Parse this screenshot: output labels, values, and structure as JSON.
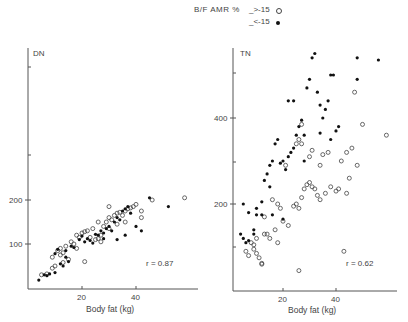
{
  "legend": {
    "title": "B/F AMR %",
    "open_label": "_>-15",
    "filled_label": "_<-15",
    "open_symbol": "open-circle",
    "filled_symbol": "filled-circle"
  },
  "caption": "",
  "chart_data": [
    {
      "type": "scatter",
      "title": "DN",
      "xlabel": "Body fat (kg)",
      "ylabel": "DN",
      "x_ticks": [
        20,
        40
      ],
      "y_ticks": [
        100,
        200
      ],
      "y_minor_ticks": [
        300,
        500
      ],
      "xlim": [
        0,
        63
      ],
      "ylim": [
        0,
        500
      ],
      "annotation": "r = 0.87",
      "series": [
        {
          "name": ">-15 (open)",
          "points": [
            [
              5,
              30
            ],
            [
              7,
              32
            ],
            [
              9,
              45
            ],
            [
              10,
              50
            ],
            [
              9,
              70
            ],
            [
              11,
              85
            ],
            [
              12,
              90
            ],
            [
              13,
              80
            ],
            [
              14,
              95
            ],
            [
              12,
              75
            ],
            [
              16,
              105
            ],
            [
              17,
              100
            ],
            [
              18,
              120
            ],
            [
              20,
              125
            ],
            [
              21,
              128
            ],
            [
              22,
              130
            ],
            [
              19,
              115
            ],
            [
              23,
              115
            ],
            [
              25,
              110
            ],
            [
              26,
              112
            ],
            [
              27,
              120
            ],
            [
              28,
              140
            ],
            [
              29,
              150
            ],
            [
              30,
              160
            ],
            [
              31,
              155
            ],
            [
              32,
              165
            ],
            [
              33,
              170
            ],
            [
              34,
              172
            ],
            [
              35,
              165
            ],
            [
              36,
              175
            ],
            [
              37,
              180
            ],
            [
              38,
              182
            ],
            [
              39,
              185
            ],
            [
              40,
              190
            ],
            [
              42,
              160
            ],
            [
              42,
              175
            ],
            [
              36,
              150
            ],
            [
              33,
              145
            ],
            [
              30,
              135
            ],
            [
              30,
              185
            ],
            [
              26,
              150
            ],
            [
              24,
              135
            ],
            [
              46,
              200
            ],
            [
              58,
              205
            ],
            [
              21,
              60
            ],
            [
              15,
              65
            ],
            [
              13,
              58
            ],
            [
              18,
              90
            ],
            [
              27,
              105
            ]
          ]
        },
        {
          "name": "<-15 (filled)",
          "points": [
            [
              4,
              18
            ],
            [
              6,
              30
            ],
            [
              7,
              28
            ],
            [
              8,
              32
            ],
            [
              10,
              35
            ],
            [
              12,
              55
            ],
            [
              13,
              50
            ],
            [
              14,
              70
            ],
            [
              15,
              60
            ],
            [
              14,
              85
            ],
            [
              16,
              95
            ],
            [
              17,
              92
            ],
            [
              19,
              110
            ],
            [
              20,
              118
            ],
            [
              21,
              105
            ],
            [
              22,
              112
            ],
            [
              23,
              108
            ],
            [
              24,
              102
            ],
            [
              26,
              120
            ],
            [
              27,
              130
            ],
            [
              28,
              125
            ],
            [
              29,
              135
            ],
            [
              30,
              140
            ],
            [
              31,
              130
            ],
            [
              32,
              150
            ],
            [
              33,
              160
            ],
            [
              34,
              155
            ],
            [
              35,
              175
            ],
            [
              36,
              180
            ],
            [
              37,
              185
            ],
            [
              38,
              170
            ],
            [
              40,
              140
            ],
            [
              42,
              130
            ],
            [
              45,
              205
            ],
            [
              52,
              185
            ],
            [
              33,
              110
            ],
            [
              36,
              120
            ],
            [
              28,
              112
            ],
            [
              10,
              78
            ],
            [
              11,
              88
            ],
            [
              25,
              122
            ]
          ]
        }
      ]
    },
    {
      "type": "scatter",
      "title": "TN",
      "xlabel": "Body fat (kg)",
      "ylabel": "TN",
      "x_ticks": [
        20,
        40
      ],
      "y_ticks": [
        200,
        400
      ],
      "y_minor_ticks": [
        100,
        300,
        500
      ],
      "xlim": [
        0,
        63
      ],
      "ylim": [
        0,
        560
      ],
      "annotation": "r = 0.62",
      "series": [
        {
          "name": ">-15 (open)",
          "points": [
            [
              6,
              90
            ],
            [
              7,
              80
            ],
            [
              9,
              105
            ],
            [
              9,
              95
            ],
            [
              10,
              85
            ],
            [
              11,
              75
            ],
            [
              12,
              62
            ],
            [
              12,
              60
            ],
            [
              8,
              110
            ],
            [
              10,
              120
            ],
            [
              13,
              130
            ],
            [
              15,
              120
            ],
            [
              17,
              140
            ],
            [
              20,
              160
            ],
            [
              22,
              150
            ],
            [
              24,
              195
            ],
            [
              25,
              200
            ],
            [
              26,
              190
            ],
            [
              27,
              215
            ],
            [
              28,
              235
            ],
            [
              29,
              245
            ],
            [
              30,
              250
            ],
            [
              31,
              240
            ],
            [
              32,
              235
            ],
            [
              33,
              220
            ],
            [
              34,
              210
            ],
            [
              36,
              225
            ],
            [
              38,
              240
            ],
            [
              40,
              230
            ],
            [
              42,
              300
            ],
            [
              44,
              320
            ],
            [
              46,
              330
            ],
            [
              48,
              290
            ],
            [
              45,
              260
            ],
            [
              35,
              315
            ],
            [
              37,
              320
            ],
            [
              30,
              310
            ],
            [
              31,
              325
            ],
            [
              34,
              290
            ],
            [
              25,
              340
            ],
            [
              26,
              350
            ],
            [
              27,
              340
            ],
            [
              21,
              290
            ],
            [
              18,
              200
            ],
            [
              16,
              210
            ],
            [
              14,
              130
            ],
            [
              13,
              170
            ],
            [
              19,
              190
            ],
            [
              41,
              235
            ],
            [
              44,
              225
            ],
            [
              50,
              385
            ],
            [
              59,
              360
            ],
            [
              27,
              385
            ],
            [
              47,
              460
            ],
            [
              26,
              45
            ],
            [
              18,
              110
            ],
            [
              43,
              90
            ]
          ]
        },
        {
          "name": "<-15 (filled)",
          "points": [
            [
              4,
              130
            ],
            [
              5,
              120
            ],
            [
              5,
              200
            ],
            [
              6,
              110
            ],
            [
              7,
              115
            ],
            [
              9,
              130
            ],
            [
              9,
              140
            ],
            [
              10,
              190
            ],
            [
              12,
              205
            ],
            [
              13,
              255
            ],
            [
              14,
              270
            ],
            [
              15,
              290
            ],
            [
              16,
              300
            ],
            [
              17,
              340
            ],
            [
              18,
              350
            ],
            [
              19,
              295
            ],
            [
              20,
              300
            ],
            [
              21,
              280
            ],
            [
              22,
              310
            ],
            [
              23,
              320
            ],
            [
              24,
              330
            ],
            [
              25,
              360
            ],
            [
              26,
              380
            ],
            [
              27,
              395
            ],
            [
              28,
              360
            ],
            [
              29,
              470
            ],
            [
              30,
              490
            ],
            [
              31,
              540
            ],
            [
              32,
              550
            ],
            [
              33,
              460
            ],
            [
              34,
              430
            ],
            [
              35,
              400
            ],
            [
              36,
              420
            ],
            [
              37,
              440
            ],
            [
              38,
              350
            ],
            [
              40,
              370
            ],
            [
              41,
              380
            ],
            [
              22,
              440
            ],
            [
              24,
              440
            ],
            [
              34,
              365
            ],
            [
              38,
              500
            ],
            [
              39,
              500
            ],
            [
              48,
              540
            ],
            [
              56,
              535
            ],
            [
              48,
              490
            ],
            [
              12,
              175
            ],
            [
              16,
              175
            ],
            [
              7,
              180
            ],
            [
              10,
              175
            ],
            [
              28,
              300
            ],
            [
              20,
              165
            ],
            [
              15,
              240
            ]
          ]
        }
      ]
    }
  ]
}
